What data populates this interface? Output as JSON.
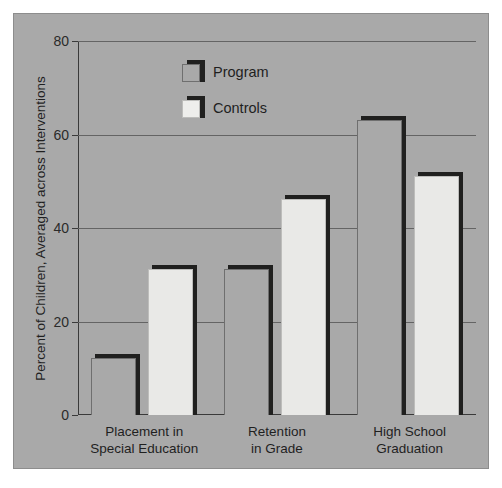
{
  "chart_data": {
    "type": "bar",
    "title": "",
    "xlabel": "",
    "ylabel": "Percent of Children, Averaged across Interventions",
    "ylim": [
      0,
      80
    ],
    "yticks": [
      0,
      20,
      40,
      60,
      80
    ],
    "ytick_labels": [
      "0",
      "20",
      "40",
      "60",
      "80"
    ],
    "grid": true,
    "legend_position": "upper-center",
    "categories": [
      "Placement in\nSpecial Education",
      "Retention\nin Grade",
      "High School\nGraduation"
    ],
    "category_lines": [
      [
        "Placement in",
        "Special Education"
      ],
      [
        "Retention",
        "in Grade"
      ],
      [
        "High School",
        "Graduation"
      ]
    ],
    "series": [
      {
        "name": "Program",
        "values": [
          13,
          32,
          64
        ]
      },
      {
        "name": "Controls",
        "values": [
          32,
          47,
          52
        ]
      }
    ],
    "colors": {
      "background": "#a9a9a9",
      "program_fill": "#a9a9a9",
      "controls_fill": "#e9e9e7",
      "shadow": "#20201f",
      "gridline": "#646464",
      "axis": "#3a3a3a",
      "text": "#1f1f1f",
      "page": "#ffffff"
    }
  }
}
